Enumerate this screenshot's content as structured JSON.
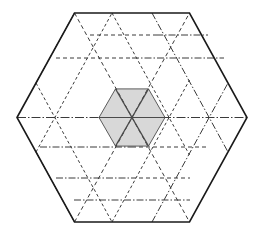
{
  "figure": {
    "type": "geometric-diagram",
    "canvas": {
      "width": 264,
      "height": 235,
      "background": "#ffffff"
    },
    "colors": {
      "outline": "#1a1a1a",
      "lattice": "#3a3a3a",
      "shaded_fill": "#d8d8d8",
      "shaded_stroke": "#4a4a4a",
      "background": "#ffffff"
    },
    "geometry": {
      "center": {
        "x": 132,
        "y": 117.5
      },
      "outer_hexagon": {
        "name": "outer-hexagon",
        "orientation": "pointy-left-right",
        "circumradius": 115,
        "apothem": 104.5,
        "vertices": [
          {
            "x": 17,
            "y": 117.5
          },
          {
            "x": 74.5,
            "y": 13
          },
          {
            "x": 189.5,
            "y": 13
          },
          {
            "x": 247,
            "y": 117.5
          },
          {
            "x": 189.5,
            "y": 222
          },
          {
            "x": 74.5,
            "y": 222
          }
        ],
        "stroke_width": 1.6,
        "style": "solid"
      },
      "inner_hexagon": {
        "name": "shaded-center-hexagon",
        "circumradius": 33,
        "vertices": [
          {
            "x": 99,
            "y": 117.5
          },
          {
            "x": 115.5,
            "y": 88.9
          },
          {
            "x": 148.5,
            "y": 88.9
          },
          {
            "x": 165,
            "y": 117.5
          },
          {
            "x": 148.5,
            "y": 146.1
          },
          {
            "x": 115.5,
            "y": 146.1
          }
        ],
        "fill": "#d8d8d8",
        "stroke_width": 1.2,
        "style": "solid",
        "subdivision": "six-triangles-from-center"
      },
      "lattice": {
        "rows": 3,
        "cell_circumradius": 38.3,
        "dash_patterns": [
          "4 3",
          "7 2 1.5 2",
          "3 2.5"
        ],
        "description": "triangular/hexagonal lattice of dashed and dash-dot lines filling the outer hexagon"
      }
    },
    "elements": [
      {
        "name": "outer-hexagon-outline",
        "style": "solid",
        "weight": "heavy"
      },
      {
        "name": "lattice-dashed-lines",
        "style": "dashed",
        "weight": "thin"
      },
      {
        "name": "lattice-dashdot-lines",
        "style": "dash-dot",
        "weight": "thin"
      },
      {
        "name": "shaded-center-hexagon",
        "style": "filled",
        "weight": "medium"
      },
      {
        "name": "center-star-diagonals",
        "style": "solid",
        "weight": "medium"
      }
    ]
  }
}
